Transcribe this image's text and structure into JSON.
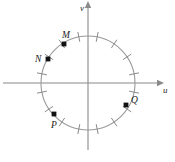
{
  "figure": {
    "background_color": "#ffffff",
    "axis_color": "#8a8a8a",
    "circle_color": "#9a9a9a",
    "tick_color": "#8a8a8a",
    "marker_color": "#111111",
    "label_color": "#1a1a1a"
  },
  "axes": {
    "horizontal": {
      "label": "u",
      "label_x": 163,
      "label_y": 93,
      "y": 83,
      "x_start": 3,
      "x_end": 157,
      "arrow": "right"
    },
    "vertical": {
      "label": "v",
      "label_x": 80,
      "label_y": 11,
      "x": 88,
      "y_start": 150,
      "y_end": 8,
      "arrow": "up"
    }
  },
  "circle": {
    "center_x": 88,
    "center_y": 83,
    "radius": 47
  },
  "ticks": {
    "count": 16,
    "spacing_degrees": 22.5,
    "offset_degrees": 11.25,
    "inner_radius": 42,
    "outer_radius": 52
  },
  "points": [
    {
      "name": "M",
      "label": "M",
      "angle_degrees": 123,
      "marker_x": 64,
      "marker_y": 44,
      "label_x": 62,
      "label_y": 38
    },
    {
      "name": "N",
      "label": "N",
      "angle_degrees": 147,
      "marker_x": 48,
      "marker_y": 59,
      "label_x": 35,
      "label_y": 62
    },
    {
      "name": "P",
      "label": "P",
      "angle_degrees": 236,
      "marker_x": 54,
      "marker_y": 114,
      "label_x": 51,
      "label_y": 128
    },
    {
      "name": "Q",
      "label": "Q",
      "angle_degrees": 332,
      "marker_x": 126,
      "marker_y": 105,
      "label_x": 131,
      "label_y": 103
    }
  ]
}
